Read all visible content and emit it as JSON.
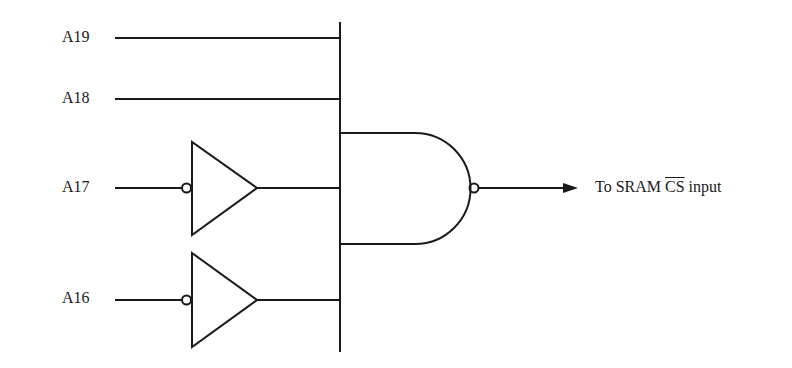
{
  "diagram": {
    "type": "logic-circuit",
    "stroke_color": "#1a1a1a",
    "inputs": [
      {
        "label": "A19",
        "inverted": false
      },
      {
        "label": "A18",
        "inverted": false
      },
      {
        "label": "A17",
        "inverted": true
      },
      {
        "label": "A16",
        "inverted": true
      }
    ],
    "gate": {
      "type": "NAND",
      "inputs": 4
    },
    "output": {
      "prefix": "To SRAM ",
      "signal": "CS",
      "signal_active_low": true,
      "suffix": " input"
    }
  }
}
